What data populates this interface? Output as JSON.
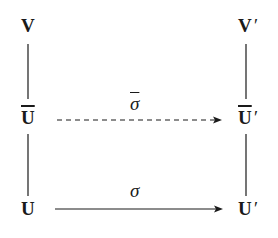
{
  "diagram": {
    "type": "commutative-diagram",
    "nodes": {
      "V": {
        "base": "V",
        "prime": ""
      },
      "V_prime": {
        "base": "V",
        "prime": "′"
      },
      "U_bar": {
        "base": "U",
        "prime": ""
      },
      "U_bar_prime": {
        "base": "U",
        "prime": "′"
      },
      "U": {
        "base": "U",
        "prime": ""
      },
      "U_prime": {
        "base": "U",
        "prime": "′"
      }
    },
    "edges": [
      {
        "from": "V",
        "to": "U_bar",
        "style": "solid",
        "arrow": false
      },
      {
        "from": "U_bar",
        "to": "U",
        "style": "solid",
        "arrow": false
      },
      {
        "from": "V_prime",
        "to": "U_bar_prime",
        "style": "solid",
        "arrow": false
      },
      {
        "from": "U_bar_prime",
        "to": "U_prime",
        "style": "solid",
        "arrow": false
      },
      {
        "from": "U_bar",
        "to": "U_bar_prime",
        "style": "dashed",
        "arrow": true,
        "label": "σ̄"
      },
      {
        "from": "U",
        "to": "U_prime",
        "style": "solid",
        "arrow": true,
        "label": "σ"
      }
    ],
    "labels": {
      "sigma_bar": "σ",
      "sigma": "σ"
    },
    "colors": {
      "ink": "#1a1a1a",
      "background": "#ffffff"
    }
  }
}
